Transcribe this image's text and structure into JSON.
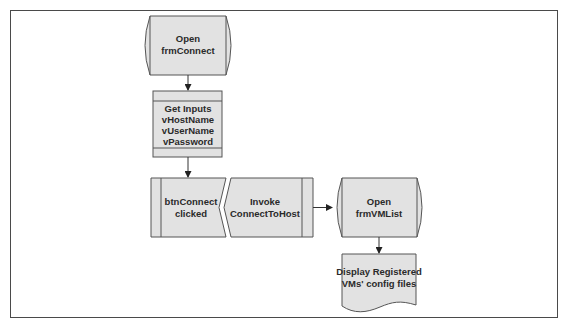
{
  "diagram": {
    "type": "flowchart",
    "colors": {
      "fill": "#e2e2e2",
      "stroke": "#555555",
      "frame": "#4a4a4a"
    },
    "nodes": [
      {
        "id": "open-frmconnect",
        "shape": "stored-data",
        "lines": [
          "Open",
          "frmConnect"
        ]
      },
      {
        "id": "get-inputs",
        "shape": "internal-storage",
        "lines": [
          "Get Inputs",
          "vHostName",
          "vUserName",
          "vPassword"
        ]
      },
      {
        "id": "btnconnect-clicked",
        "shape": "event",
        "lines": [
          "btnConnect",
          "clicked"
        ]
      },
      {
        "id": "invoke-connecttohost",
        "shape": "process",
        "lines": [
          "Invoke",
          "ConnectToHost"
        ]
      },
      {
        "id": "open-frmvmlist",
        "shape": "stored-data",
        "lines": [
          "Open",
          "frmVMList"
        ]
      },
      {
        "id": "display-registered",
        "shape": "document",
        "lines": [
          "Display Registered",
          "VMs' config files"
        ]
      }
    ],
    "edges": [
      {
        "from": "open-frmconnect",
        "to": "get-inputs"
      },
      {
        "from": "get-inputs",
        "to": "btnconnect-clicked"
      },
      {
        "from": "btnconnect-clicked",
        "to": "invoke-connecttohost"
      },
      {
        "from": "invoke-connecttohost",
        "to": "open-frmvmlist"
      },
      {
        "from": "open-frmvmlist",
        "to": "display-registered"
      }
    ]
  }
}
